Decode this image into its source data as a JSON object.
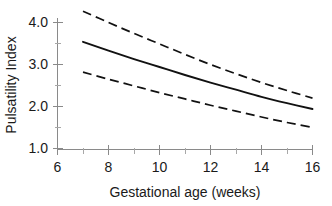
{
  "chart_data": {
    "type": "line",
    "title": "",
    "subtitle": "",
    "xlabel": "Gestational age (weeks)",
    "ylabel": "Pulsatility Index",
    "xlim": [
      6,
      16
    ],
    "ylim": [
      1.0,
      4.4
    ],
    "x_ticks": [
      6,
      8,
      10,
      12,
      14,
      16
    ],
    "x_tick_labels": [
      "6",
      "8",
      "10",
      "12",
      "14",
      "16"
    ],
    "x_minor_ticks": [
      7,
      9,
      11,
      13,
      15
    ],
    "y_ticks": [
      1.0,
      2.0,
      3.0,
      4.0
    ],
    "y_tick_labels": [
      "1.0",
      "2.0",
      "3.0",
      "4.0"
    ],
    "y_minor_ticks": [
      1.5,
      2.5,
      3.5
    ],
    "grid": false,
    "legend": null,
    "legend_position": "none",
    "line_color": "#111111",
    "x": [
      7,
      8,
      9,
      10,
      11,
      12,
      13,
      14,
      15,
      16
    ],
    "series": [
      {
        "name": "Upper 95% limit",
        "style": "dashed",
        "values": [
          4.27,
          4.0,
          3.74,
          3.49,
          3.24,
          3.0,
          2.78,
          2.57,
          2.38,
          2.2
        ]
      },
      {
        "name": "Mean pulsatility index",
        "style": "solid",
        "values": [
          3.54,
          3.33,
          3.13,
          2.94,
          2.75,
          2.57,
          2.4,
          2.23,
          2.08,
          1.94
        ]
      },
      {
        "name": "Lower 95% limit",
        "style": "dashed",
        "values": [
          2.82,
          2.65,
          2.49,
          2.33,
          2.18,
          2.03,
          1.89,
          1.75,
          1.62,
          1.5
        ]
      }
    ]
  },
  "axes": {
    "x_title": "Gestational age (weeks)",
    "y_title": "Pulsatility Index"
  },
  "x_tick_text": {
    "t0": "6",
    "t1": "8",
    "t2": "10",
    "t3": "12",
    "t4": "14",
    "t5": "16"
  },
  "y_tick_text": {
    "t0": "1.0",
    "t1": "2.0",
    "t2": "3.0",
    "t3": "4.0"
  }
}
